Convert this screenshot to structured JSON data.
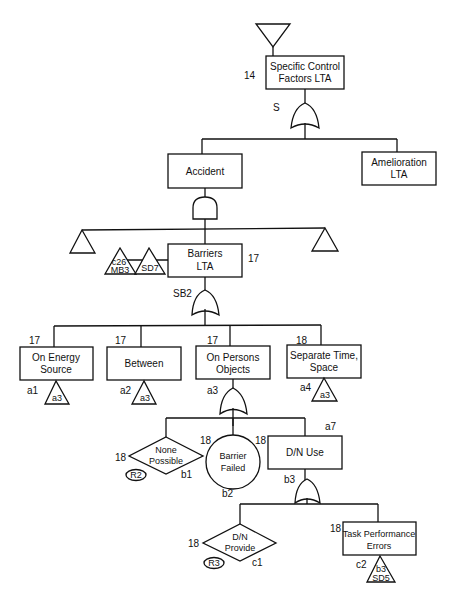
{
  "diagram": {
    "type": "fault-tree",
    "top_transfer": "transfer-in triangle",
    "nodes": {
      "top": {
        "line1": "Specific Control",
        "line2": "Factors LTA",
        "ref": "14",
        "gate_label": "S",
        "gate": "OR"
      },
      "accident": {
        "label": "Accident",
        "gate": "AND"
      },
      "amelioration": {
        "line1": "Amelioration",
        "line2": "LTA"
      },
      "barriers": {
        "line1": "Barriers",
        "line2": "LTA",
        "ref": "17",
        "gate_label": "SB2",
        "gate": "OR"
      },
      "transfer_c26": {
        "line1": "c26",
        "line2": "MB3"
      },
      "transfer_sd7": {
        "label": "SD7"
      },
      "energy_source": {
        "line1": "On Energy",
        "line2": "Source",
        "ref": "17",
        "code": "a1",
        "transfer": "a3"
      },
      "between": {
        "label": "Between",
        "ref": "17",
        "code": "a2",
        "transfer": "a3"
      },
      "persons_objects": {
        "line1": "On Persons",
        "line2": "Objects",
        "ref": "17",
        "code": "a3",
        "gate": "OR"
      },
      "separate": {
        "line1": "Separate Time,",
        "line2": "Space",
        "ref": "18",
        "code": "a4",
        "transfer": "a3"
      },
      "none_possible": {
        "line1": "None",
        "line2": "Possible",
        "ref": "18",
        "code": "b1",
        "tag": "R2"
      },
      "barrier_failed": {
        "line1": "Barrier",
        "line2": "Failed",
        "ref": "18",
        "code": "b2"
      },
      "dn_use": {
        "label": "D/N Use",
        "ref": "18",
        "code": "a7",
        "gate_label": "b3",
        "gate": "OR"
      },
      "dn_provide": {
        "line1": "D/N",
        "line2": "Provide",
        "ref": "18",
        "code": "c1",
        "tag": "R3"
      },
      "task_perf": {
        "line1": "Task Performance",
        "line2": "Errors",
        "ref": "18",
        "code": "c2",
        "transfer_line1": "b3",
        "transfer_line2": "SD5"
      }
    }
  }
}
